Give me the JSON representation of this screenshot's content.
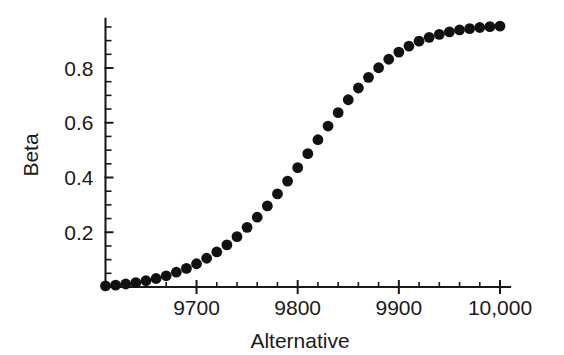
{
  "chart_data": {
    "type": "scatter",
    "title": "",
    "subtitle": "",
    "xlabel": "Alternative",
    "ylabel": "Beta",
    "xlim": [
      9610,
      10010
    ],
    "ylim": [
      0,
      0.98
    ],
    "grid": false,
    "legend": null,
    "marker": {
      "shape": "circle",
      "color": "#111111",
      "size": 5.4
    },
    "x_ticks": [
      {
        "value": 9700,
        "label": "9700",
        "major": true
      },
      {
        "value": 9800,
        "label": "9800",
        "major": true
      },
      {
        "value": 9900,
        "label": "9900",
        "major": true
      },
      {
        "value": 10000,
        "label": "10,000",
        "major": true
      }
    ],
    "x_minor_ticks": [
      9630,
      9650,
      9670,
      9720,
      9740,
      9760,
      9780,
      9820,
      9840,
      9860,
      9880,
      9920,
      9940,
      9960,
      9980
    ],
    "y_ticks": [
      {
        "value": 0.2,
        "label": "0.2",
        "major": true
      },
      {
        "value": 0.4,
        "label": "0.4",
        "major": true
      },
      {
        "value": 0.6,
        "label": "0.6",
        "major": true
      },
      {
        "value": 0.8,
        "label": "0.8",
        "major": true
      }
    ],
    "y_minor_ticks": [
      0.05,
      0.1,
      0.15,
      0.25,
      0.3,
      0.35,
      0.45,
      0.5,
      0.55,
      0.65,
      0.7,
      0.75,
      0.85,
      0.9,
      0.95
    ],
    "series": [
      {
        "name": "Beta",
        "x": [
          9610,
          9620,
          9630,
          9640,
          9650,
          9660,
          9670,
          9680,
          9690,
          9700,
          9710,
          9720,
          9730,
          9740,
          9750,
          9760,
          9770,
          9780,
          9790,
          9800,
          9810,
          9820,
          9830,
          9840,
          9850,
          9860,
          9870,
          9880,
          9890,
          9900,
          9910,
          9920,
          9930,
          9940,
          9950,
          9960,
          9970,
          9980,
          9990,
          10000
        ],
        "values": [
          0.004,
          0.007,
          0.011,
          0.016,
          0.023,
          0.031,
          0.041,
          0.054,
          0.068,
          0.085,
          0.105,
          0.128,
          0.154,
          0.184,
          0.218,
          0.255,
          0.296,
          0.34,
          0.387,
          0.436,
          0.487,
          0.538,
          0.588,
          0.637,
          0.684,
          0.727,
          0.766,
          0.801,
          0.832,
          0.858,
          0.88,
          0.898,
          0.912,
          0.923,
          0.932,
          0.939,
          0.944,
          0.948,
          0.951,
          0.953
        ]
      }
    ]
  },
  "axis": {
    "x_title": "Alternative",
    "y_title": "Beta"
  }
}
